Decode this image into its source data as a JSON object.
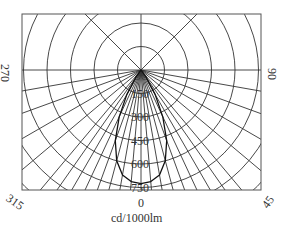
{
  "chart_data": {
    "type": "polar",
    "title": "",
    "unit_label": "cd/1000lm",
    "angle_labels": [
      {
        "text": "0",
        "angle": 0
      },
      {
        "text": "90",
        "angle": 90
      },
      {
        "text": "270",
        "angle": 270
      },
      {
        "text": "45",
        "angle": 45
      },
      {
        "text": "315",
        "angle": 315
      }
    ],
    "radial_ticks": [
      150,
      300,
      450,
      600,
      750
    ],
    "radial_grid_step": 150,
    "radial_max": 1050,
    "grid": true,
    "series": [
      {
        "name": "C0-C180",
        "angles": [
          -40,
          -35,
          -30,
          -25,
          -20,
          -15,
          -10,
          -5,
          0,
          5,
          10,
          15,
          20,
          25,
          30,
          35,
          40
        ],
        "values": [
          0,
          60,
          180,
          330,
          480,
          600,
          680,
          715,
          725,
          715,
          680,
          600,
          480,
          330,
          180,
          60,
          0
        ]
      }
    ]
  },
  "labels": {
    "bottom_zero": "0",
    "unit": "cd/1000lm",
    "left": "270",
    "right": "90",
    "bottom_left": "315",
    "bottom_right": "45",
    "ticks": [
      "150",
      "300",
      "450",
      "600",
      "750"
    ]
  }
}
